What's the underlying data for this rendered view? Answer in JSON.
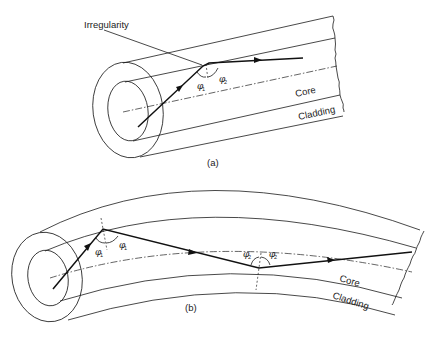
{
  "figure_a": {
    "caption": "(a)",
    "labels": {
      "irregularity": "Irregularity",
      "core": "Core",
      "cladding": "Cladding",
      "phi1": "φ",
      "phi1_sub": "1",
      "phi2": "φ",
      "phi2_sub": "2"
    }
  },
  "figure_b": {
    "caption": "(b)",
    "labels": {
      "core": "Core",
      "cladding": "Cladding",
      "phi1_left": "φ",
      "phi1_left_sub": "1",
      "phi1_right": "φ",
      "phi1_right_sub": "1",
      "phi2_left": "φ",
      "phi2_left_sub": "2",
      "phi2_right": "φ",
      "phi2_right_sub": "2"
    }
  },
  "colors": {
    "line": "#1a1a1a",
    "background": "#ffffff"
  }
}
